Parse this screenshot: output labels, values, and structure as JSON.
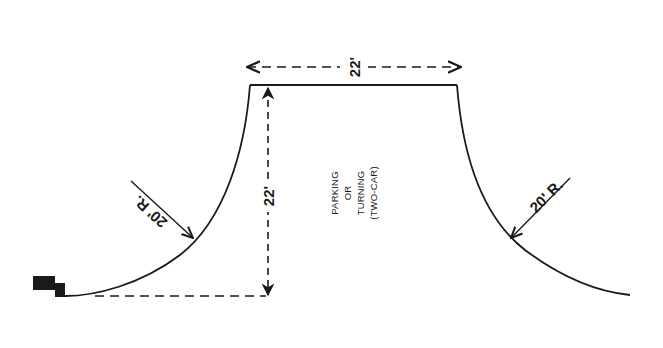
{
  "diagram": {
    "colors": {
      "ink": "#1a1a1a",
      "background": "#ffffff"
    },
    "dimensions": {
      "top_width": "22'",
      "depth": "22'"
    },
    "radii": {
      "left": "20' R.",
      "right": "20' R."
    },
    "area_label": {
      "lines": [
        "PARKING",
        "OR",
        "TURNING",
        "(TWO-CAR)"
      ]
    }
  }
}
